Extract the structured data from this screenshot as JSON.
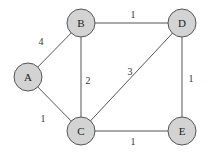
{
  "graph": {
    "nodes": [
      {
        "id": "A",
        "label": "A",
        "x": 28,
        "y": 77
      },
      {
        "id": "B",
        "label": "B",
        "x": 81,
        "y": 23
      },
      {
        "id": "C",
        "label": "C",
        "x": 81,
        "y": 131
      },
      {
        "id": "D",
        "label": "D",
        "x": 182,
        "y": 23
      },
      {
        "id": "E",
        "label": "E",
        "x": 182,
        "y": 131
      }
    ],
    "edges": [
      {
        "from": "A",
        "to": "B",
        "weight": "4",
        "lx": 41,
        "ly": 41
      },
      {
        "from": "A",
        "to": "C",
        "weight": "1",
        "lx": 43,
        "ly": 118
      },
      {
        "from": "B",
        "to": "D",
        "weight": "1",
        "lx": 133,
        "ly": 14
      },
      {
        "from": "B",
        "to": "C",
        "weight": "2",
        "lx": 88,
        "ly": 80
      },
      {
        "from": "C",
        "to": "D",
        "weight": "3",
        "lx": 130,
        "ly": 71
      },
      {
        "from": "D",
        "to": "E",
        "weight": "1",
        "lx": 191,
        "ly": 78
      },
      {
        "from": "C",
        "to": "E",
        "weight": "1",
        "lx": 133,
        "ly": 140
      }
    ],
    "node_radius": 14,
    "node_fill": "#d3d3d3",
    "stroke_color": "#555555"
  }
}
